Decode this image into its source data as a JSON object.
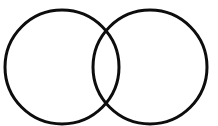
{
  "canvas": {
    "width": 218,
    "height": 126,
    "background_color": "#ffffff"
  },
  "figure": {
    "name": "two-intersecting-circles",
    "stroke_color": "#0d0d0d",
    "stroke_width": 3,
    "fill": "none"
  },
  "clipped_text": {
    "visible_fragment": "",
    "note": "bottom sliver of a cut-off line of text at the top edge"
  },
  "chart_data": {
    "type": "diagram",
    "diagram_type": "venn",
    "title": "",
    "background": "#ffffff",
    "stroke": "#0d0d0d",
    "stroke_width": 3,
    "fill": "none",
    "set_count": 2,
    "circles": [
      {
        "label": "",
        "cx": 62,
        "cy": 67,
        "r": 57
      },
      {
        "label": "",
        "cx": 150,
        "cy": 67,
        "r": 57
      }
    ],
    "center_distance": 88,
    "intersection_points": [
      {
        "x": 110,
        "y": 24
      },
      {
        "x": 110,
        "y": 110
      }
    ],
    "regions": [
      {
        "name": "left-only",
        "label": ""
      },
      {
        "name": "overlap",
        "label": ""
      },
      {
        "name": "right-only",
        "label": ""
      }
    ],
    "labels": [],
    "legend": null,
    "grid": false
  }
}
